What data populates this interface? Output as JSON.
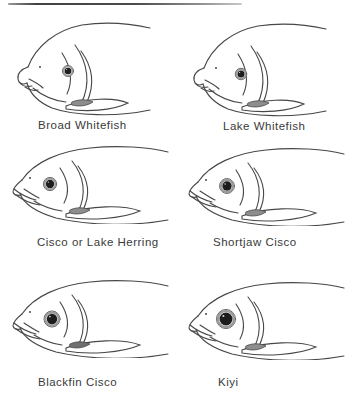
{
  "figure": {
    "panels": [
      {
        "label": "Broad Whitefish",
        "illustration": "broad-whitefish-head-illustration"
      },
      {
        "label": "Lake Whitefish",
        "illustration": "lake-whitefish-head-illustration"
      },
      {
        "label": "Cisco or Lake Herring",
        "illustration": "cisco-or-lake-herring-head-illustration"
      },
      {
        "label": "Shortjaw Cisco",
        "illustration": "shortjaw-cisco-head-illustration"
      },
      {
        "label": "Blackfin Cisco",
        "illustration": "blackfin-cisco-head-illustration"
      },
      {
        "label": "Kiyi",
        "illustration": "kiyi-head-illustration"
      }
    ]
  },
  "colors": {
    "line": "#474747",
    "pupil": "#1d1d1d",
    "iris_ring": "#9b9b9b",
    "axil_shade": "#8d8d8d",
    "axil_shade_dark": "#6f6f6f",
    "text": "#3a3a3a",
    "rule_dark": "#414141",
    "rule_light": "#c9c9c9",
    "background": "#ffffff"
  }
}
